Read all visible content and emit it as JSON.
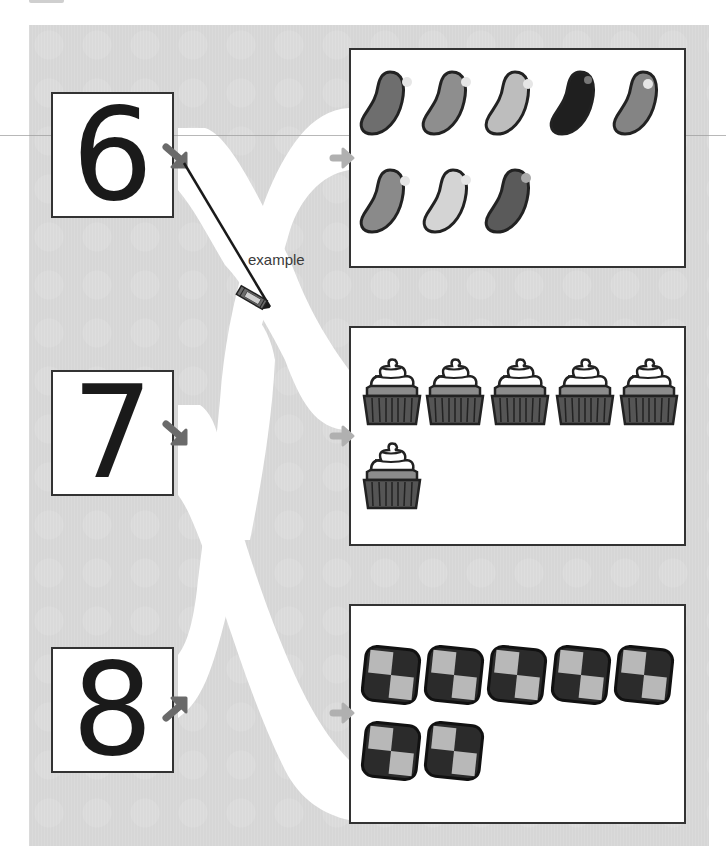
{
  "worksheet": {
    "instruction_example_label": "example",
    "numbers": [
      {
        "value": "6",
        "arrow": "down-right"
      },
      {
        "value": "7",
        "arrow": "down-right"
      },
      {
        "value": "8",
        "arrow": "up-right"
      }
    ],
    "picture_groups": [
      {
        "item": "jelly bean",
        "count": 8,
        "row1": 5,
        "row2": 3,
        "shades": [
          "#6e6e6e",
          "#8e8e8e",
          "#bdbdbd",
          "#1f1f1f",
          "#848484",
          "#8a8a8a",
          "#d4d4d4",
          "#5a5a5a"
        ]
      },
      {
        "item": "cupcake",
        "count": 6,
        "row1": 5,
        "row2": 1
      },
      {
        "item": "checkered cookie",
        "count": 7,
        "row1": 5,
        "row2": 2
      }
    ],
    "example_line": {
      "from": "6",
      "to": "cupcake group"
    }
  },
  "colors": {
    "panel": "#d6d6d6",
    "path": "#ffffff",
    "arrow_dark": "#6a6a6a",
    "arrow_light": "#b0b0b0",
    "border": "#333333"
  }
}
